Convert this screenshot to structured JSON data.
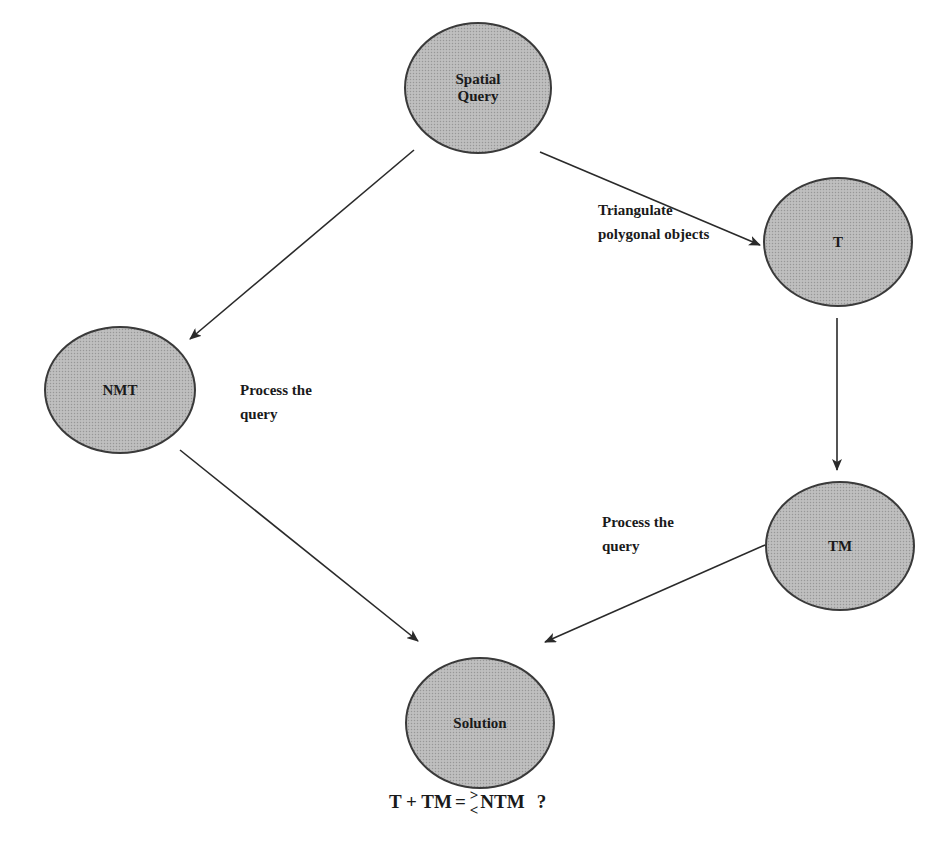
{
  "diagram": {
    "nodes": [
      {
        "id": "spatial-query",
        "label": "Spatial\nQuery",
        "cx": 478,
        "cy": 88,
        "rx": 74,
        "ry": 66
      },
      {
        "id": "t",
        "label": "T",
        "cx": 838,
        "cy": 242,
        "rx": 75,
        "ry": 65
      },
      {
        "id": "nmt",
        "label": "NMT",
        "cx": 120,
        "cy": 390,
        "rx": 76,
        "ry": 64
      },
      {
        "id": "tm",
        "label": "TM",
        "cx": 840,
        "cy": 546,
        "rx": 75,
        "ry": 65
      },
      {
        "id": "solution",
        "label": "Solution",
        "cx": 480,
        "cy": 723,
        "rx": 75,
        "ry": 66
      }
    ],
    "edges": [
      {
        "from": "spatial-query",
        "to": "nmt",
        "x1": 414,
        "y1": 150,
        "x2": 190,
        "y2": 339
      },
      {
        "from": "spatial-query",
        "to": "t",
        "x1": 540,
        "y1": 152,
        "x2": 760,
        "y2": 245
      },
      {
        "from": "t",
        "to": "tm",
        "x1": 837,
        "y1": 318,
        "x2": 837,
        "y2": 470
      },
      {
        "from": "nmt",
        "to": "solution",
        "x1": 180,
        "y1": 450,
        "x2": 418,
        "y2": 641
      },
      {
        "from": "tm",
        "to": "solution",
        "x1": 765,
        "y1": 545,
        "x2": 545,
        "y2": 642
      }
    ],
    "edge_labels": [
      {
        "id": "triangulate",
        "text": "Triangulate\npolygonal objects",
        "x": 598,
        "y": 198
      },
      {
        "id": "process-nmt",
        "text": "Process the\nquery",
        "x": 240,
        "y": 378
      },
      {
        "id": "process-tm",
        "text": "Process the\nquery",
        "x": 602,
        "y": 510
      }
    ],
    "equation": {
      "lhs": "T + TM",
      "equals": "=",
      "greater": ">",
      "less": "<",
      "rhs": "NTM",
      "question": "?"
    },
    "colors": {
      "node_fill": "#b9b9b9",
      "node_stroke": "#3a3a3a",
      "edge": "#2a2a2a",
      "text": "#1a1a1a"
    }
  }
}
